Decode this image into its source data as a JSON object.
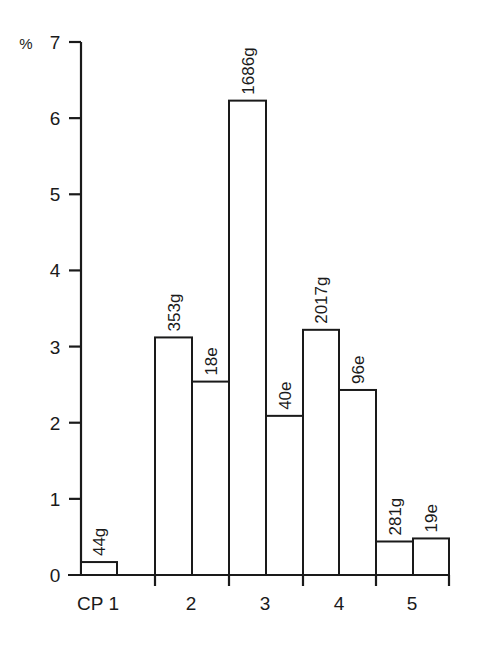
{
  "chart_data": {
    "type": "bar",
    "title": "",
    "xlabel": "",
    "ylabel": "%",
    "ylim": [
      0,
      7
    ],
    "yticks": [
      0,
      1,
      2,
      3,
      4,
      5,
      6,
      7
    ],
    "grid": false,
    "legend": null,
    "categories": [
      "CP 1",
      "2",
      "3",
      "4",
      "5"
    ],
    "bars": [
      {
        "group": "CP 1",
        "label": "44g",
        "value": 0.17
      },
      {
        "group": "2",
        "label": "353g",
        "value": 3.12
      },
      {
        "group": "2",
        "label": "18e",
        "value": 2.54
      },
      {
        "group": "3",
        "label": "1686g",
        "value": 6.23
      },
      {
        "group": "3",
        "label": "40e",
        "value": 2.09
      },
      {
        "group": "4",
        "label": "2017g",
        "value": 3.22
      },
      {
        "group": "4",
        "label": "96e",
        "value": 2.43
      },
      {
        "group": "5",
        "label": "281g",
        "value": 0.44
      },
      {
        "group": "5",
        "label": "19e",
        "value": 0.48
      }
    ]
  },
  "axis": {
    "y_unit": "%",
    "y_tick_labels": [
      "0",
      "1",
      "2",
      "3",
      "4",
      "5",
      "6",
      "7"
    ],
    "x_labels": [
      "CP 1",
      "2",
      "3",
      "4",
      "5"
    ]
  }
}
